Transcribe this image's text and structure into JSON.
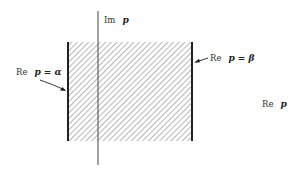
{
  "figure": {
    "type": "complex-plane strip diagram",
    "labels": {
      "imaginary_axis_prefix": "Im",
      "imaginary_axis_var": "p",
      "real_axis_prefix": "Re",
      "real_axis_var": "p",
      "left_boundary_prefix": "Re",
      "left_boundary_expr": "p = α",
      "right_boundary_prefix": "Re",
      "right_boundary_expr": "p = β"
    },
    "region": {
      "description": "vertical strip α < Re p < β, hatched",
      "hatch": "diagonal"
    },
    "colors": {
      "axis": "#444444",
      "boundary": "#222222",
      "hatch": "#777777",
      "background": "#ffffff"
    }
  }
}
